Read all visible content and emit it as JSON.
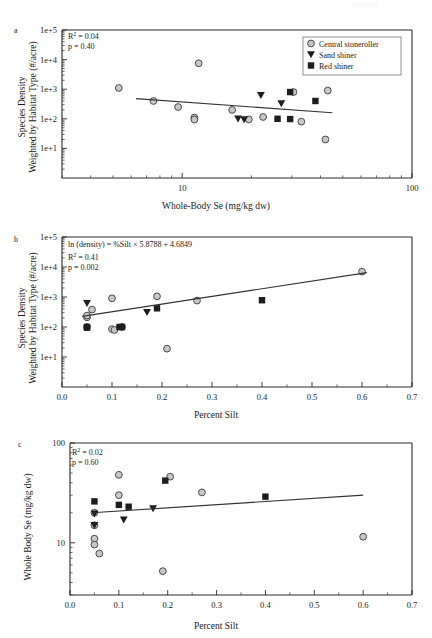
{
  "figure": {
    "background": "#ffffff",
    "marker_colors": {
      "circle_fill": "#c8c8c8",
      "circle_stroke": "#4a4a4a",
      "triangle_fill": "#1d1d1d",
      "square_fill": "#1d1d1d",
      "trendline": "#333333",
      "axis": "#2b2b2b"
    },
    "legend": {
      "position": "top-right-panel-a",
      "entries": [
        {
          "marker": "circle",
          "label": "Central stoneroller"
        },
        {
          "marker": "triangle-down",
          "label": "Sand shiner"
        },
        {
          "marker": "square",
          "label": "Red shiner"
        }
      ]
    }
  },
  "panels": {
    "a": {
      "letter": "a",
      "xlabel": "Whole-Body Se (mg/kg dw)",
      "ylabel_line1": "Species Density",
      "ylabel_line2": "Weighted by Habitat Type (#/acre)",
      "xticklabels": [
        "10",
        "100"
      ],
      "yticklabels": [
        "1e+1",
        "1e+2",
        "1e+3",
        "1e+4",
        "1e+5"
      ],
      "annotations": [
        "R2 = 0.04",
        "p = 0.40"
      ],
      "r2_text": "R",
      "r2_sup": "2",
      "r2_value": " = 0.04",
      "p_text": "p = 0.40"
    },
    "b": {
      "letter": "b",
      "xlabel": "Percent Silt",
      "ylabel_line1": "Species Density",
      "ylabel_line2": "Weighted by Habitat Type (#/acre)",
      "xticklabels": [
        "0.0",
        "0.1",
        "0.2",
        "0.3",
        "0.4",
        "0.5",
        "0.6",
        "0.7"
      ],
      "yticklabels": [
        "1e+1",
        "1e+2",
        "1e+3",
        "1e+4",
        "1e+5"
      ],
      "equation": "ln (density) = %Silt × 5.8788 + 4.6849",
      "r2_text": "R",
      "r2_sup": "2",
      "r2_value": " = 0.41",
      "p_text": "p = 0.002"
    },
    "c": {
      "letter": "c",
      "xlabel": "Percent Silt",
      "ylabel": "Whole Body Se (mg/kg dw)",
      "xticklabels": [
        "0.0",
        "0.1",
        "0.2",
        "0.3",
        "0.4",
        "0.5",
        "0.6",
        "0.7"
      ],
      "yticklabels": [
        "10",
        "100"
      ],
      "r2_text": "R",
      "r2_sup": "2",
      "r2_value": " = 0.02",
      "p_text": "p = 0.60"
    }
  },
  "chart_data": [
    {
      "id": "panel-a",
      "type": "scatter",
      "title": "",
      "xlabel": "Whole-Body Se (mg/kg dw)",
      "ylabel": "Species Density Weighted by Habitat Type (#/acre)",
      "xscale": "log",
      "yscale": "log",
      "xlim": [
        3,
        100
      ],
      "ylim": [
        1,
        100000
      ],
      "xticks": [
        10,
        100
      ],
      "yticks": [
        10,
        100,
        1000,
        10000,
        100000
      ],
      "grid": false,
      "annotations": [
        "R² = 0.04",
        "p = 0.40"
      ],
      "legend": [
        "Central stoneroller",
        "Sand shiner",
        "Red shiner"
      ],
      "trendline": {
        "x": [
          6.3,
          45
        ],
        "y": [
          480,
          160
        ]
      },
      "series": [
        {
          "name": "Central stoneroller",
          "marker": "circle",
          "points": [
            [
              5.3,
              1100
            ],
            [
              7.5,
              400
            ],
            [
              9.6,
              250
            ],
            [
              11.3,
              110
            ],
            [
              11.3,
              95
            ],
            [
              11.8,
              7500
            ],
            [
              16.5,
              200
            ],
            [
              19.5,
              95
            ],
            [
              22.5,
              115
            ],
            [
              30.5,
              800
            ],
            [
              33.0,
              80
            ],
            [
              43.0,
              900
            ],
            [
              42.0,
              20
            ]
          ]
        },
        {
          "name": "Sand shiner",
          "marker": "triangle-down",
          "points": [
            [
              17.5,
              100
            ],
            [
              18.6,
              95
            ],
            [
              22.0,
              620
            ],
            [
              27.0,
              330
            ]
          ]
        },
        {
          "name": "Red shiner",
          "marker": "square",
          "points": [
            [
              26.0,
              100
            ],
            [
              29.5,
              98
            ],
            [
              29.5,
              800
            ],
            [
              38.0,
              400
            ]
          ]
        }
      ]
    },
    {
      "id": "panel-b",
      "type": "scatter",
      "title": "",
      "xlabel": "Percent Silt",
      "ylabel": "Species Density Weighted by Habitat Type (#/acre)",
      "xscale": "linear",
      "yscale": "log",
      "xlim": [
        0.0,
        0.7
      ],
      "ylim": [
        1,
        100000
      ],
      "xticks": [
        0.0,
        0.1,
        0.2,
        0.3,
        0.4,
        0.5,
        0.6,
        0.7
      ],
      "yticks": [
        10,
        100,
        1000,
        10000,
        100000
      ],
      "grid": false,
      "annotations": [
        "ln (density) = %Silt × 5.8788 + 4.6849",
        "R² = 0.41",
        "p = 0.002"
      ],
      "equation": {
        "form": "ln(density) = %Silt x 5.8788 + 4.6849",
        "slope": 5.8788,
        "intercept": 4.6849
      },
      "trendline": {
        "x": [
          0.04,
          0.61
        ],
        "y": [
          225,
          6500
        ]
      },
      "series": [
        {
          "name": "Central stoneroller",
          "marker": "circle",
          "points": [
            [
              0.05,
              210
            ],
            [
              0.05,
              240
            ],
            [
              0.05,
              100
            ],
            [
              0.06,
              380
            ],
            [
              0.1,
              85
            ],
            [
              0.1,
              900
            ],
            [
              0.105,
              80
            ],
            [
              0.12,
              100
            ],
            [
              0.19,
              1050
            ],
            [
              0.21,
              19
            ],
            [
              0.27,
              760
            ],
            [
              0.6,
              7000
            ]
          ]
        },
        {
          "name": "Sand shiner",
          "marker": "triangle-down",
          "points": [
            [
              0.05,
              620
            ],
            [
              0.17,
              310
            ]
          ]
        },
        {
          "name": "Red shiner",
          "marker": "square",
          "points": [
            [
              0.05,
              100
            ],
            [
              0.05,
              95
            ],
            [
              0.115,
              100
            ],
            [
              0.12,
              100
            ],
            [
              0.19,
              420
            ],
            [
              0.4,
              780
            ]
          ]
        }
      ]
    },
    {
      "id": "panel-c",
      "type": "scatter",
      "title": "",
      "xlabel": "Percent Silt",
      "ylabel": "Whole Body Se (mg/kg dw)",
      "xscale": "linear",
      "yscale": "log",
      "xlim": [
        0.0,
        0.7
      ],
      "ylim": [
        3,
        100
      ],
      "xticks": [
        0.0,
        0.1,
        0.2,
        0.3,
        0.4,
        0.5,
        0.6,
        0.7
      ],
      "yticks": [
        10,
        100
      ],
      "grid": false,
      "annotations": [
        "R² = 0.02",
        "p = 0.60"
      ],
      "trendline": {
        "x": [
          0.045,
          0.6
        ],
        "y": [
          20.0,
          30.0
        ]
      },
      "series": [
        {
          "name": "Central stoneroller",
          "marker": "circle",
          "points": [
            [
              0.05,
              20
            ],
            [
              0.05,
              15
            ],
            [
              0.05,
              11
            ],
            [
              0.05,
              9.6
            ],
            [
              0.06,
              7.8
            ],
            [
              0.1,
              48
            ],
            [
              0.1,
              30
            ],
            [
              0.19,
              5.2
            ],
            [
              0.205,
              46
            ],
            [
              0.27,
              32
            ],
            [
              0.6,
              11.5
            ]
          ]
        },
        {
          "name": "Sand shiner",
          "marker": "triangle-down",
          "points": [
            [
              0.05,
              19.5
            ],
            [
              0.05,
              15
            ],
            [
              0.11,
              17
            ],
            [
              0.17,
              22
            ]
          ]
        },
        {
          "name": "Red shiner",
          "marker": "square",
          "points": [
            [
              0.05,
              26
            ],
            [
              0.1,
              24
            ],
            [
              0.12,
              23
            ],
            [
              0.195,
              42
            ],
            [
              0.4,
              29
            ]
          ]
        }
      ]
    }
  ]
}
